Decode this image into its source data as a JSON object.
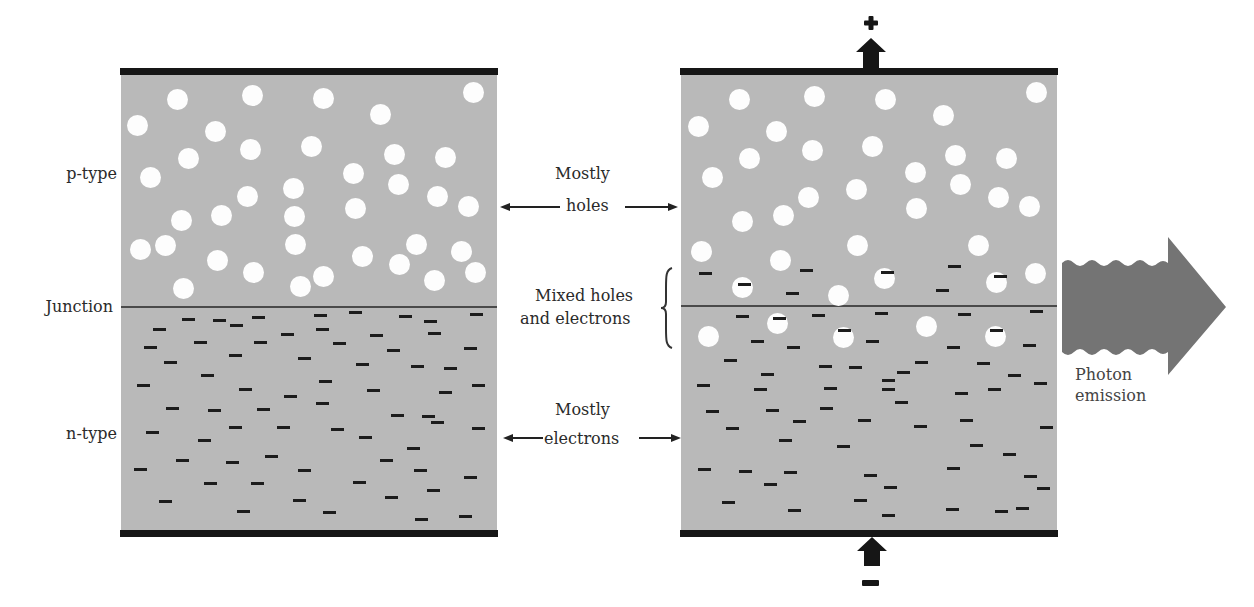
{
  "labels": {
    "p_type": "p-type",
    "junction": "Junction",
    "n_type": "n-type",
    "mostly_holes_1": "Mostly",
    "mostly_holes_2": "holes",
    "mixed_1": "Mixed holes",
    "mixed_2": "and electrons",
    "mostly_electrons_1": "Mostly",
    "mostly_electrons_2": "electrons",
    "photon_1": "Photon",
    "photon_2": "emission",
    "plus": "+",
    "minus": "−"
  },
  "colors": {
    "semiconductor_fill": "#b9b9b9",
    "electrode": "#161616",
    "hole": "#fdfdfd",
    "electron": "#1c1c1c",
    "photon_arrow": "#747474"
  },
  "panels": [
    {
      "name": "unbiased-junction",
      "state": "no bias"
    },
    {
      "name": "forward-biased-junction",
      "state": "forward bias with photon emission"
    }
  ]
}
